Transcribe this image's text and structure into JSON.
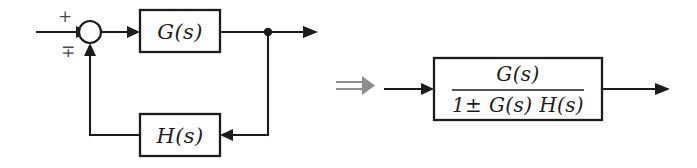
{
  "figure": {
    "background_color": "#ffffff",
    "line_color": "#1c1c1c",
    "implies_color": "#8e8e8e"
  },
  "left_diagram": {
    "name": "feedback-loop",
    "input_sign": "+",
    "feedback_sign": "∓",
    "summing_junction": {
      "shape": "circle",
      "cx": 90,
      "cy": 32,
      "r": 11
    },
    "forward_block": {
      "label": "G(s)",
      "x": 140,
      "y": 10,
      "width": 80,
      "height": 42
    },
    "feedback_block": {
      "label": "H(s)",
      "x": 140,
      "y": 114,
      "width": 80,
      "height": 42
    },
    "takeoff_node": {
      "cx": 268,
      "cy": 32,
      "r": 4
    }
  },
  "operator": {
    "symbol": "⟹",
    "name": "implies-arrow"
  },
  "right_diagram": {
    "name": "closed-loop-transfer-function",
    "block": {
      "x": 434,
      "y": 58,
      "width": 168,
      "height": 62
    },
    "numerator": "G(s)",
    "denominator": "1± G(s) H(s)",
    "fraction": "G(s) / (1 ± G(s) H(s))"
  }
}
